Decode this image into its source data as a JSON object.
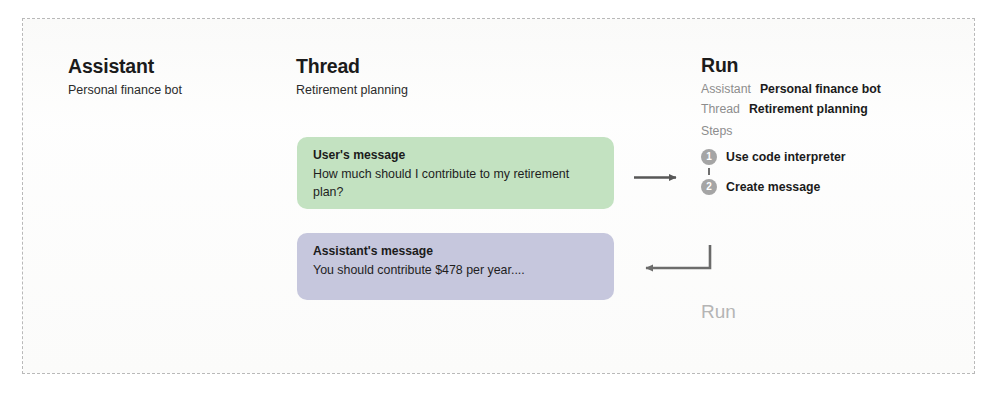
{
  "diagram": {
    "frame_style": "dashed-border"
  },
  "assistant_panel": {
    "title": "Assistant",
    "subtitle": "Personal finance bot"
  },
  "thread_panel": {
    "title": "Thread",
    "subtitle": "Retirement planning",
    "messages": [
      {
        "role": "user",
        "label": "User's message",
        "text": "How much should I contribute to my retirement plan?",
        "color": "#c3e2c1"
      },
      {
        "role": "assistant",
        "label": "Assistant's message",
        "text": "You should contribute $478 per year....",
        "color": "#c6c7dd"
      }
    ]
  },
  "run_panel": {
    "title": "Run",
    "rows": [
      {
        "key": "Assistant",
        "value": "Personal finance bot"
      },
      {
        "key": "Thread",
        "value": "Retirement planning"
      }
    ],
    "steps_label": "Steps",
    "steps": [
      {
        "number": "1",
        "label": "Use code interpreter"
      },
      {
        "number": "2",
        "label": "Create message"
      }
    ],
    "footer_label": "Run",
    "badge_color": "#a5a5a5",
    "muted_color": "#8d8d8d"
  },
  "arrows": [
    {
      "name": "thread-to-run",
      "direction": "right"
    },
    {
      "name": "run-to-thread",
      "direction": "left-elbow"
    }
  ]
}
